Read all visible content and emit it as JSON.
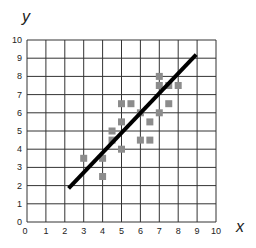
{
  "chart_data": {
    "type": "scatter",
    "title": "",
    "xlabel": "x",
    "ylabel": "y",
    "xlim": [
      0,
      10
    ],
    "ylim": [
      0,
      10
    ],
    "grid": true,
    "x_ticks": [
      "0",
      "1",
      "2",
      "3",
      "4",
      "5",
      "6",
      "7",
      "8",
      "9",
      "10"
    ],
    "y_ticks": [
      "0",
      "1",
      "2",
      "3",
      "4",
      "5",
      "6",
      "7",
      "8",
      "9",
      "10"
    ],
    "series": [
      {
        "name": "data points",
        "marker": "square",
        "color": "#8c8c8c",
        "points": [
          [
            3,
            3.5
          ],
          [
            4,
            3.5
          ],
          [
            4,
            2.5
          ],
          [
            4.5,
            4.5
          ],
          [
            4.5,
            5
          ],
          [
            5,
            4
          ],
          [
            5,
            5.5
          ],
          [
            5,
            6.5
          ],
          [
            5.5,
            6.5
          ],
          [
            6,
            6
          ],
          [
            6,
            4.5
          ],
          [
            6.5,
            4.5
          ],
          [
            6.5,
            5.5
          ],
          [
            7,
            6
          ],
          [
            7,
            7.5
          ],
          [
            7,
            8
          ],
          [
            7.5,
            7.5
          ],
          [
            7.5,
            6.5
          ],
          [
            8,
            7.5
          ]
        ]
      },
      {
        "name": "line of best fit",
        "type": "line",
        "color": "#000000",
        "points": [
          [
            2.2,
            1.85
          ],
          [
            8.95,
            9.2
          ]
        ]
      }
    ],
    "legend": "none"
  },
  "style": {
    "grid_color": "#333333",
    "point_color": "#8c8c8c",
    "line_color": "#000000"
  }
}
